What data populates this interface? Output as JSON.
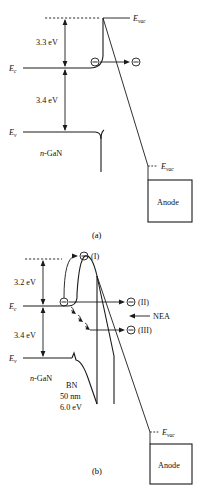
{
  "figure": {
    "type": "energy-band-diagram",
    "background_color": "#ffffff",
    "line_color": "#1a1a1a"
  },
  "panel_a": {
    "caption": "(a)",
    "labels": {
      "e_vac_top": "E",
      "e_vac_top_sub": "vac",
      "e_vac_anode": "E",
      "e_vac_anode_sub": "vac",
      "e_c": "E",
      "e_c_sub": "c",
      "e_v": "E",
      "e_v_sub": "v",
      "barrier_energy": "3.3 eV",
      "bandgap_energy": "3.4 eV",
      "material": "n-GaN",
      "material_italic": "n",
      "material_rest": "-GaN",
      "anode": "Anode"
    },
    "electrons": [
      {
        "name": "electron-surface",
        "symbol": "⊖"
      },
      {
        "name": "electron-emitted",
        "symbol": "⊖"
      }
    ]
  },
  "panel_b": {
    "caption": "(b)",
    "labels": {
      "e_vac_anode": "E",
      "e_vac_anode_sub": "vac",
      "e_c": "E",
      "e_c_sub": "c",
      "e_v": "E",
      "e_v_sub": "v",
      "barrier_energy": "3.2 eV",
      "bandgap_energy": "3.4 eV",
      "material": "n-GaN",
      "material_italic": "n",
      "material_rest": "-GaN",
      "bn_name": "BN",
      "bn_thickness": "50 nm",
      "bn_energy": "6.0 eV",
      "nea": "NEA",
      "anode": "Anode"
    },
    "electrons": [
      {
        "name": "electron-source",
        "symbol": "⊖"
      },
      {
        "name": "electron-path-I",
        "symbol": "⊖",
        "tag": "(I)"
      },
      {
        "name": "electron-path-II",
        "symbol": "⊖",
        "tag": "(II)"
      },
      {
        "name": "electron-path-III",
        "symbol": "⊖",
        "tag": "(III)"
      }
    ]
  }
}
